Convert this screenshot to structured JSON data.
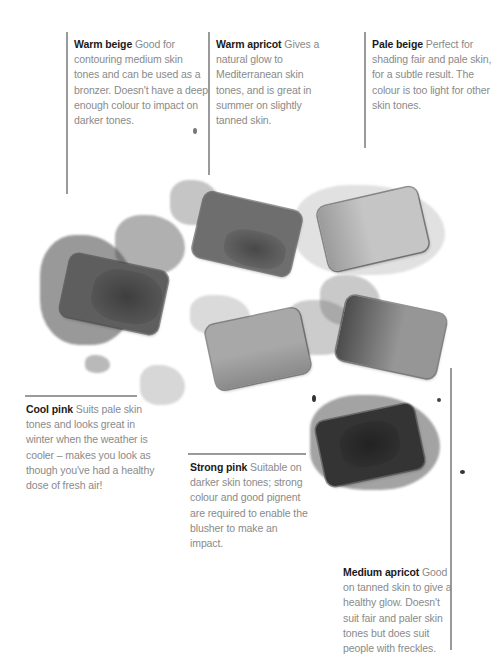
{
  "captions": [
    {
      "id": "warm-beige",
      "name": "Warm beige",
      "text": "Good for contouring medium skin tones and can be used as a bronzer. Doesn't have a deep enough colour to impact on darker tones.",
      "lines": [
        "Good for",
        "contouring medium skin",
        "tones and can be used as",
        "a bronzer. Doesn't have a",
        "deep enough colour to",
        "impact on darker tones."
      ]
    },
    {
      "id": "warm-apricot",
      "name": "Warm apricot",
      "text": "Gives a natural glow to Mediterranean skin tones, and is great in summer on slightly tanned skin.",
      "lines": [
        "Gives",
        "a natural glow to",
        "Mediterranean skin",
        "tones, and is great in",
        "summer on slightly",
        "tanned skin."
      ]
    },
    {
      "id": "pale-beige",
      "name": "Pale beige",
      "text": "Perfect for shading fair and pale skin, for a subtle result. The colour is too light for other skin tones.",
      "lines": [
        "Perfect for",
        "shading fair and pale",
        "skin, for a subtle result.",
        "The colour is too light",
        "for other skin tones."
      ]
    },
    {
      "id": "cool-pink",
      "name": "Cool pink",
      "text": "Suits pale skin tones and looks great in winter when the weather is cooler – makes you look as though you've had a healthy dose of fresh air!",
      "lines": [
        "Suits pale",
        "skin tones and looks",
        "great in winter when the",
        "weather is cooler –",
        "makes you look as",
        "though you've had a",
        "healthy dose of fresh air!"
      ]
    },
    {
      "id": "strong-pink",
      "name": "Strong pink",
      "text": "Suitable on darker skin tones; strong colour and good pignent are required to enable the blusher to make an impact.",
      "lines": [
        "Suitable",
        "on darker skin tones;",
        "strong colour and good",
        "pignent are required to",
        "enable the blusher to",
        "make an impact."
      ]
    },
    {
      "id": "medium-apricot",
      "name": "Medium apricot",
      "text": "Good on tanned skin to give a healthy glow. Doesn't suit fair and paler skin tones but does suit people with freckles.",
      "lines": [
        "Good",
        "on tanned skin to give a",
        "healthy glow. Doesn't",
        "suit fair and paler skin",
        "tones but does suit",
        "people with freckles."
      ]
    }
  ],
  "colors": {
    "heading": "#1a1a1a",
    "body_text": "#8a8a8a",
    "leader_line": "#9a9a9a"
  },
  "compacts": [
    {
      "shade": "Cool pink",
      "tone": "#555555"
    },
    {
      "shade": "Warm beige",
      "tone": "#6a6a6a"
    },
    {
      "shade": "Pale beige",
      "tone": "#b8b8b8"
    },
    {
      "shade": "Medium apricot",
      "tone": "#8e8e8e"
    },
    {
      "shade": "Warm apricot",
      "tone": "#a5a5a5"
    },
    {
      "shade": "Strong pink",
      "tone": "#333333"
    }
  ]
}
